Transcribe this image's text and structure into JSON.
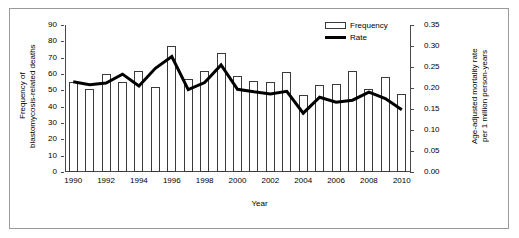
{
  "chart_data": {
    "type": "bar",
    "title": "",
    "xlabel": "Year",
    "ylabel": "Frequency of blastomycosis-related deaths",
    "y2label": "Age-adjusted mortality rate per 1 million person-years",
    "categories": [
      1990,
      1991,
      1992,
      1993,
      1994,
      1995,
      1996,
      1997,
      1998,
      1999,
      2000,
      2001,
      2002,
      2003,
      2004,
      2005,
      2006,
      2007,
      2008,
      2009,
      2010
    ],
    "x_tick_labels": [
      "1990",
      "1992",
      "1994",
      "1996",
      "1998",
      "2000",
      "2002",
      "2004",
      "2006",
      "2008",
      "2010"
    ],
    "y_tick_labels": [
      "0",
      "10",
      "20",
      "30",
      "40",
      "50",
      "60",
      "70",
      "80",
      "90"
    ],
    "y2_tick_labels": [
      "0.00",
      "0.05",
      "0.10",
      "0.15",
      "0.20",
      "0.25",
      "0.30",
      "0.35"
    ],
    "ylim": [
      0,
      90
    ],
    "y2lim": [
      0,
      0.35
    ],
    "grid": false,
    "legend_position": "top-right",
    "series": [
      {
        "name": "Frequency",
        "kind": "bar",
        "axis": "left",
        "color": "#ffffff",
        "edge_color": "#3a3a3a",
        "values": [
          55,
          51,
          60,
          55,
          62,
          52,
          77,
          57,
          62,
          73,
          59,
          56,
          55,
          61,
          47,
          53,
          54,
          62,
          51,
          58,
          48
        ]
      },
      {
        "name": "Rate",
        "kind": "line",
        "axis": "right",
        "color": "#000000",
        "values": [
          0.215,
          0.208,
          0.212,
          0.233,
          0.205,
          0.247,
          0.275,
          0.196,
          0.213,
          0.255,
          0.197,
          0.191,
          0.186,
          0.192,
          0.14,
          0.178,
          0.166,
          0.171,
          0.19,
          0.175,
          0.148
        ]
      }
    ]
  },
  "legend": {
    "items": [
      {
        "label": "Frequency",
        "swatch": "bar-outline"
      },
      {
        "label": "Rate",
        "swatch": "thick-line"
      }
    ]
  },
  "axes": {
    "left_title": "Frequency of\nblastomycosis-related deaths",
    "right_title": "Age-adjusted mortality rate\nper 1 million person-years",
    "bottom_title": "Year"
  },
  "colors": {
    "bar_fill": "#ffffff",
    "bar_edge": "#3a3a3a",
    "line": "#000000",
    "axis": "#4a4a4a",
    "frame": "#9a9a9a",
    "text": "#000000"
  }
}
